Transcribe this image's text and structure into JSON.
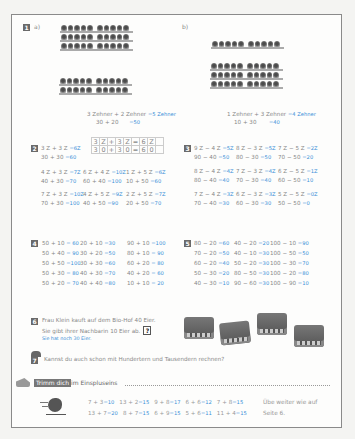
{
  "task1": {
    "number": "1",
    "a": {
      "label": "a)",
      "line1": "3 Zehner + 2 Zehner",
      "answer1": "=5 Zehner",
      "line2": "30  +  20",
      "answer2": "=50",
      "bars_top": 3,
      "bars_bottom": 2
    },
    "b": {
      "label": "b)",
      "line1": "1 Zehner + 3 Zehner",
      "answer1": "=4 Zehner",
      "line2": "10  +  30",
      "answer2": "=40",
      "bars_top": 1,
      "bars_bottom": 3
    }
  },
  "task2": {
    "number": "2",
    "grid_row1": [
      "3",
      "Z",
      "+",
      "3",
      "Z",
      "=",
      "6",
      "Z",
      ""
    ],
    "grid_row2": [
      "3",
      "0",
      "+",
      "3",
      "0",
      "=",
      "6",
      "0",
      ""
    ],
    "items": [
      {
        "q1": "3 Z + 3 Z",
        "a1": "=6Z",
        "q2": "30 + 30",
        "a2": "=60"
      },
      {
        "q1": "4 Z + 3 Z",
        "a1": "=7Z",
        "q2": "40 + 30",
        "a2": "=70"
      },
      {
        "q1": "6 Z + 4 Z",
        "a1": "=10Z",
        "q2": "60 + 40",
        "a2": "=100"
      },
      {
        "q1": "1 Z + 5 Z",
        "a1": "=6Z",
        "q2": "10 + 50",
        "a2": "=60"
      },
      {
        "q1": "7 Z + 3 Z",
        "a1": "=10Z",
        "q2": "70 + 30",
        "a2": "=100"
      },
      {
        "q1": "4 Z + 5 Z",
        "a1": "=9Z",
        "q2": "40 + 50",
        "a2": "=90"
      },
      {
        "q1": "2 Z + 5 Z",
        "a1": "=7Z",
        "q2": "20 + 50",
        "a2": "=70"
      }
    ]
  },
  "task3": {
    "number": "3",
    "items": [
      {
        "q1": "9 Z − 4 Z",
        "a1": "=5Z",
        "q2": "90 − 40",
        "a2": "=50"
      },
      {
        "q1": "8 Z − 3 Z",
        "a1": "=5Z",
        "q2": "80 − 30",
        "a2": "=50"
      },
      {
        "q1": "7 Z − 5 Z",
        "a1": "=2Z",
        "q2": "70 − 50",
        "a2": "=20"
      },
      {
        "q1": "8 Z − 4 Z",
        "a1": "=4Z",
        "q2": "80 − 40",
        "a2": "=40"
      },
      {
        "q1": "7 Z − 3 Z",
        "a1": "=4Z",
        "q2": "70 − 30",
        "a2": "=40"
      },
      {
        "q1": "6 Z − 5 Z",
        "a1": "=1Z",
        "q2": "60 − 50",
        "a2": "=10"
      },
      {
        "q1": "7 Z − 4 Z",
        "a1": "=3Z",
        "q2": "70 − 40",
        "a2": "=30"
      },
      {
        "q1": "6 Z − 3 Z",
        "a1": "=3Z",
        "q2": "60 − 30",
        "a2": "=30"
      },
      {
        "q1": "5 Z − 5 Z",
        "a1": "=0Z",
        "q2": "50 − 50",
        "a2": "=0"
      }
    ]
  },
  "task4": {
    "number": "4",
    "columns": [
      [
        {
          "q": "50 + 10",
          "a": "=  60"
        },
        {
          "q": "50 + 40",
          "a": "=  90"
        },
        {
          "q": "50 + 50",
          "a": "=100"
        },
        {
          "q": "50 + 30",
          "a": "=  80"
        },
        {
          "q": "50 + 20",
          "a": "=  70"
        }
      ],
      [
        {
          "q": "20 + 10",
          "a": "=30"
        },
        {
          "q": "30 + 20",
          "a": "=50"
        },
        {
          "q": "30 + 30",
          "a": "=60"
        },
        {
          "q": "40 + 30",
          "a": "=70"
        },
        {
          "q": "40 + 40",
          "a": "=80"
        }
      ],
      [
        {
          "q": "90 + 10",
          "a": "=100"
        },
        {
          "q": "80 + 10",
          "a": "=  90"
        },
        {
          "q": "60 + 20",
          "a": "=  80"
        },
        {
          "q": "40 + 20",
          "a": "=  60"
        },
        {
          "q": "10 + 10",
          "a": "=  20"
        }
      ]
    ]
  },
  "task5": {
    "number": "5",
    "columns": [
      [
        {
          "q": "80 − 20",
          "a": "=60"
        },
        {
          "q": "70 − 20",
          "a": "=50"
        },
        {
          "q": "60 − 20",
          "a": "=40"
        },
        {
          "q": "50 − 30",
          "a": "=20"
        },
        {
          "q": "40 − 30",
          "a": "=10"
        }
      ],
      [
        {
          "q": "40 − 20",
          "a": "=20"
        },
        {
          "q": "40 − 10",
          "a": "=30"
        },
        {
          "q": "50 − 20",
          "a": "=30"
        },
        {
          "q": "80 − 50",
          "a": "=30"
        },
        {
          "q": "90 − 60",
          "a": "=30"
        }
      ],
      [
        {
          "q": "100 − 10",
          "a": "=90"
        },
        {
          "q": "100 − 50",
          "a": "=50"
        },
        {
          "q": "100 − 30",
          "a": "=70"
        },
        {
          "q": "100 − 20",
          "a": "=80"
        },
        {
          "q": "100 − 90",
          "a": "=10"
        }
      ]
    ]
  },
  "task6": {
    "number": "6",
    "line1": "Frau Klein kauft auf dem Bio-Hof 40 Eier.",
    "line2": "Sie gibt ihrer Nachbarin 10 Eier ab.",
    "question_mark": "?",
    "answer": "Sie hat noch 30 Eier."
  },
  "task7": {
    "number": "7",
    "text": "Kannst du auch schon mit Hundertern und Tausendern rechnen?"
  },
  "trimm": {
    "badge": "Trimm dich",
    "title": "im Einspluseins",
    "row1": [
      {
        "q": "7 + 3",
        "a": "=10"
      },
      {
        "q": "13 + 2",
        "a": "=15"
      },
      {
        "q": "9 + 8",
        "a": "=17"
      },
      {
        "q": "6 + 6",
        "a": "=12"
      },
      {
        "q": "7 + 8",
        "a": "=15"
      }
    ],
    "row2": [
      {
        "q": "13 + 7",
        "a": "=20"
      },
      {
        "q": "8 + 7",
        "a": "=15"
      },
      {
        "q": "6 + 9",
        "a": "=15"
      },
      {
        "q": "5 + 6",
        "a": "=11"
      },
      {
        "q": "11 + 4",
        "a": "=15"
      }
    ],
    "note1": "Übe weiter wie auf",
    "note2": "Seite 6."
  },
  "colors": {
    "answer": "#3a8fd8",
    "badge": "#6a6a6a",
    "border": "#8a8a8a"
  }
}
